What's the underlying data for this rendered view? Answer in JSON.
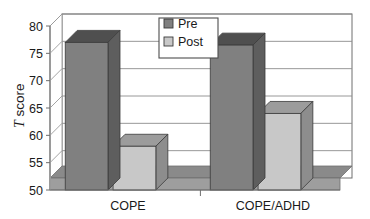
{
  "chart_data": {
    "type": "bar",
    "title": "",
    "subtitle": "",
    "xlabel": "",
    "ylabel": "T score",
    "ylabel_italic_part": "T",
    "ylabel_plain_part": " score",
    "categories": [
      "COPE",
      "COPE/ADHD"
    ],
    "series": [
      {
        "name": "Pre",
        "values": [
          77,
          76.5
        ],
        "color": "#808080"
      },
      {
        "name": "Post",
        "values": [
          58,
          64
        ],
        "color": "#c8c8c8"
      }
    ],
    "ylim": [
      50,
      80
    ],
    "ytick_values": [
      50,
      55,
      60,
      65,
      70,
      75,
      80
    ],
    "ytick_labels": [
      "50",
      "55",
      "60",
      "65",
      "70",
      "75",
      "80"
    ],
    "grid": true,
    "grid_axis": "y",
    "legend_position": "upper center",
    "style": "3d-bar",
    "annotations": []
  },
  "legend": {
    "items": [
      {
        "label": "Pre",
        "swatch_color": "#808080"
      },
      {
        "label": "Post",
        "swatch_color": "#c8c8c8"
      }
    ],
    "border_color": "#4d4d4d",
    "background": "#ffffff"
  },
  "axes": {
    "y_title": "T score",
    "y_ticks": [
      "80",
      "75",
      "70",
      "65",
      "60",
      "55",
      "50"
    ],
    "x_ticks": [
      "COPE",
      "COPE/ADHD"
    ]
  },
  "colors": {
    "series_pre": "#808080",
    "series_post": "#c8c8c8",
    "pre_top": "#4f4f4f",
    "pre_side": "#5e5e5e",
    "post_top": "#9c9c9c",
    "post_side": "#8d8d8d",
    "floor": "#8a8a8a",
    "floor_front": "#9e9e9e",
    "gridline": "#8c8c8c",
    "frame": "#6e6e6e",
    "axis": "#9a9a9a",
    "text": "#1a1a1a",
    "background": "#ffffff"
  }
}
